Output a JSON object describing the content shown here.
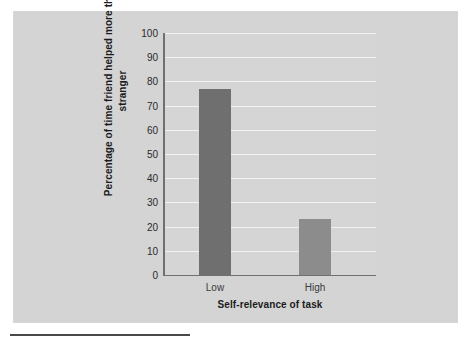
{
  "chart_data": {
    "type": "bar",
    "title": "",
    "categories": [
      "Low",
      "High"
    ],
    "values": [
      77,
      23
    ],
    "series": [
      {
        "name": "Percentage of time friend helped more than stranger",
        "values": [
          77,
          23
        ]
      }
    ],
    "xlabel": "Self-relevance of task",
    "ylabel": "Percentage of time friend helped more than stranger",
    "ylabel_line1": "Percentage of time friend helped",
    "ylabel_line2": "more than stranger",
    "ylim": [
      0,
      100
    ],
    "ytick_values": [
      100,
      90,
      80,
      70,
      60,
      50,
      40,
      30,
      20,
      10,
      0
    ],
    "ytick_labels": [
      "100",
      "90",
      "80",
      "70",
      "60",
      "50",
      "40",
      "30",
      "20",
      "10",
      "0"
    ],
    "grid": true,
    "legend": false,
    "bar_colors": [
      "#6f6f6f",
      "#8c8c8c"
    ],
    "plot_background": "#d5d5d5",
    "gridline_color": "#f2f2f2",
    "axis_color": "#6f6f6f"
  },
  "figure": {
    "panel_color": "#d9d9d9",
    "rule_color": "#4a4a4a"
  }
}
